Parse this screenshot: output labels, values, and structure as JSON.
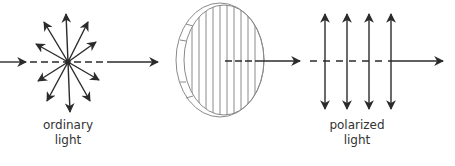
{
  "diagram": {
    "title": "",
    "colors": {
      "ink": "#2b2b2b",
      "lens_stroke": "#8a8a8a",
      "text": "#333333",
      "background": "#ffffff"
    },
    "beam_y": 62,
    "nodes": [
      {
        "id": "ordinary-light",
        "type": "starburst",
        "center": [
          68,
          62
        ]
      },
      {
        "id": "polarizer",
        "type": "polarizing-filter",
        "center": [
          220,
          60
        ]
      },
      {
        "id": "polarized-light",
        "type": "parallel-vertical-arrows",
        "x": [
          325,
          347,
          369,
          391
        ]
      }
    ],
    "edges": [
      {
        "from": "source",
        "to": "ordinary-light"
      },
      {
        "from": "ordinary-light",
        "to": "polarizer"
      },
      {
        "from": "polarizer",
        "to": "polarized-light"
      },
      {
        "from": "polarized-light",
        "to": "exit"
      }
    ],
    "labels": {
      "ordinary_line1": "ordinary",
      "ordinary_line2": "light",
      "polarized_line1": "polarized",
      "polarized_line2": "light"
    }
  }
}
